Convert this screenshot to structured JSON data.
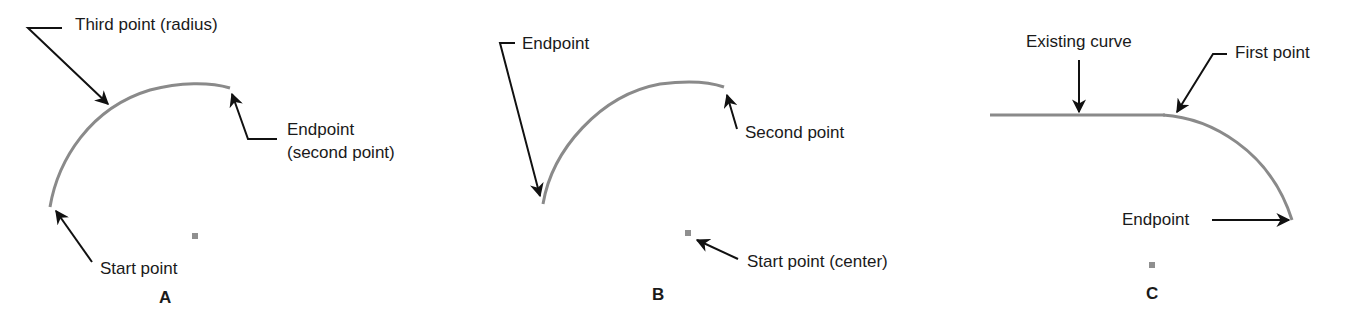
{
  "figure": {
    "colors": {
      "curve": "#8a8a8a",
      "leader": "#111111",
      "text": "#1a1a1a",
      "point": "#8f8f8f"
    },
    "panels": [
      {
        "id": "A",
        "caption": "A",
        "labels": {
          "third_point": "Third point (radius)",
          "endpoint_line1": "Endpoint",
          "endpoint_line2": "(second point)",
          "start_point": "Start point"
        }
      },
      {
        "id": "B",
        "caption": "B",
        "labels": {
          "endpoint": "Endpoint",
          "second_point": "Second point",
          "start_point": "Start point (center)"
        }
      },
      {
        "id": "C",
        "caption": "C",
        "labels": {
          "existing_curve": "Existing curve",
          "first_point": "First point",
          "endpoint": "Endpoint"
        }
      }
    ]
  }
}
